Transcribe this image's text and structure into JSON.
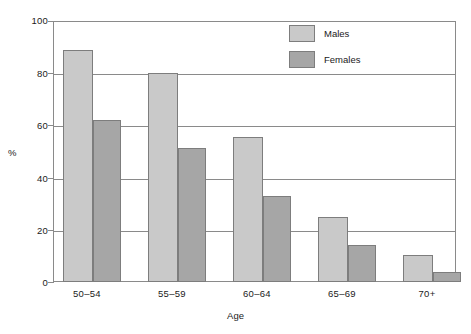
{
  "chart_data": {
    "type": "bar",
    "title": "",
    "xlabel": "Age",
    "ylabel": "%",
    "categories": [
      "50–54",
      "55–59",
      "60–64",
      "65–69",
      "70+"
    ],
    "series": [
      {
        "name": "Males",
        "color": "#c9c9c9",
        "values": [
          89,
          80,
          55.5,
          25,
          10.5
        ]
      },
      {
        "name": "Females",
        "color": "#a6a6a6",
        "values": [
          62,
          51.5,
          33,
          14,
          4
        ]
      }
    ],
    "ylim": [
      0,
      100
    ],
    "yticks": [
      0,
      20,
      40,
      60,
      80,
      100
    ],
    "ytick_labels": [
      "0",
      "20",
      "40",
      "60",
      "80",
      "100"
    ],
    "grid": "horizontal",
    "legend_position": "top-right"
  },
  "axes": {
    "y_title": "%",
    "x_title": "Age",
    "y_labels": [
      "100",
      "80",
      "60",
      "40",
      "20",
      "0"
    ],
    "x_labels": [
      "50–54",
      "55–59",
      "60–64",
      "65–69",
      "70+"
    ]
  },
  "legend": {
    "items": [
      {
        "label": "Males",
        "swatch": "males-swatch"
      },
      {
        "label": "Females",
        "swatch": "females-swatch"
      }
    ]
  },
  "caption": {
    "cropped_text": ""
  }
}
